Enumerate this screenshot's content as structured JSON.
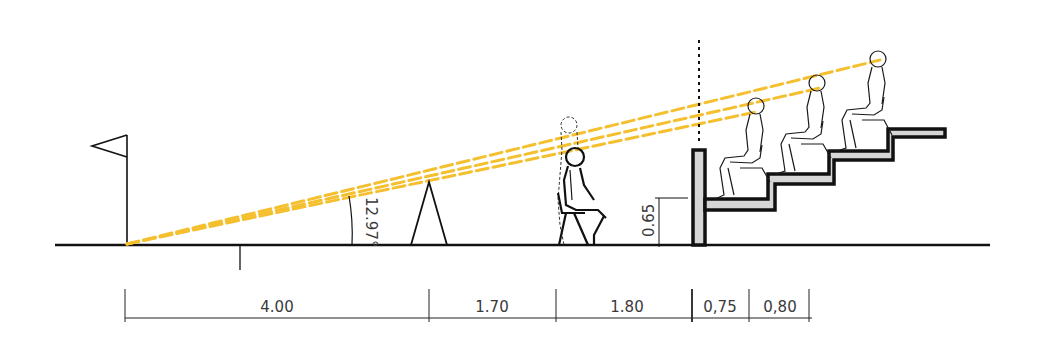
{
  "diagram": {
    "colors": {
      "sightline": "#f5c030",
      "line": "#111111",
      "concrete_fill": "#d6d6d6",
      "text": "#3a3a3a"
    },
    "angle_label": "12.97°",
    "height_label": "0.65",
    "dimensions": [
      {
        "label": "4.00",
        "from_x": 125,
        "to_x": 429
      },
      {
        "label": "1.70",
        "from_x": 429,
        "to_x": 556
      },
      {
        "label": "1.80",
        "from_x": 556,
        "to_x": 692
      },
      {
        "label": "0,75",
        "from_x": 692,
        "to_x": 749
      },
      {
        "label": "0,80",
        "from_x": 749,
        "to_x": 809
      }
    ],
    "elements": {
      "flag": "corner-flag",
      "focal_point": "sightline-origin-at-pitch-edge",
      "advertising_board": "A-frame advertising board",
      "photographer": "kneeling/sitting person on stool with standing ghost outline",
      "barrier_wall": "front barrier wall",
      "tiers": 3,
      "spectators": 3
    }
  }
}
